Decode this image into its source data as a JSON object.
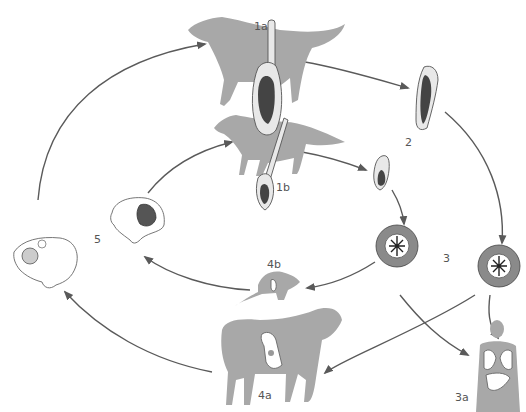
{
  "diagram": {
    "type": "life-cycle",
    "labels": {
      "dog_adult_worm": "1a",
      "fox_adult_worm": "1b",
      "proglottid": "2",
      "eggs": "3",
      "human_host": "3a",
      "sheep_host": "4a",
      "rodent_host": "4b",
      "cysts": "5"
    },
    "stages": [
      {
        "id": "1a",
        "name": "Dog definitive host with adult tapeworm"
      },
      {
        "id": "1b",
        "name": "Fox definitive host with adult tapeworm"
      },
      {
        "id": "2",
        "name": "Gravid proglottids"
      },
      {
        "id": "3",
        "name": "Eggs in feces"
      },
      {
        "id": "3a",
        "name": "Human accidental host (lungs/liver)"
      },
      {
        "id": "4a",
        "name": "Sheep intermediate host"
      },
      {
        "id": "4b",
        "name": "Rodent intermediate host"
      },
      {
        "id": "5",
        "name": "Hydatid cysts in organs"
      }
    ],
    "colors": {
      "silhouette": "#a8a8a8",
      "arrow": "#5a5a5a",
      "label": "#555555"
    }
  }
}
